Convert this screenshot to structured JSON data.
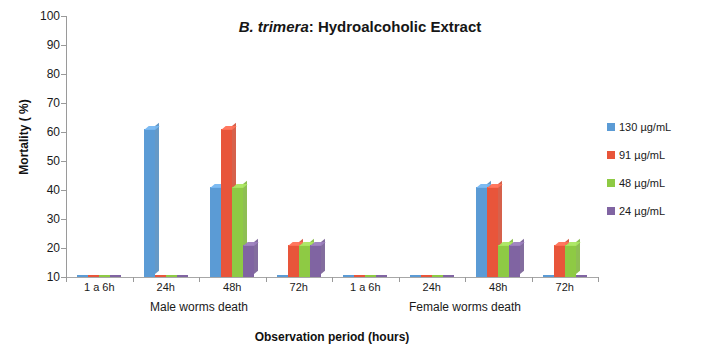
{
  "chart_data": {
    "type": "bar",
    "title": "B. trimera: Hydroalcoholic Extract",
    "title_species": "B. trimera",
    "title_rest": ": Hydroalcoholic Extract",
    "xlabel": "Observation period (hours)",
    "ylabel": "Mortality ( %)",
    "ylim": [
      10,
      100
    ],
    "ytick_step": 10,
    "yticks": [
      "100",
      "90",
      "80",
      "70",
      "60",
      "50",
      "40",
      "30",
      "20",
      "10"
    ],
    "grid": false,
    "legend_position": "right",
    "categories": [
      "1 a 6h",
      "24h",
      "48h",
      "72h",
      "1 a 6h",
      "24h",
      "48h",
      "72h"
    ],
    "groups": [
      {
        "label": "Male worms death",
        "categories": [
          "1 a 6h",
          "24h",
          "48h",
          "72h"
        ]
      },
      {
        "label": "Female worms death",
        "categories": [
          "1 a 6h",
          "24h",
          "48h",
          "72h"
        ]
      }
    ],
    "series": [
      {
        "name": "130 µg/mL",
        "color": "#5B9BD5",
        "values": [
          0,
          61,
          41,
          0,
          0,
          0,
          41,
          0
        ]
      },
      {
        "name": "91 µg/mL",
        "color": "#E8553A",
        "values": [
          0,
          0,
          61,
          21,
          0,
          0,
          41,
          21
        ]
      },
      {
        "name": "48 µg/mL",
        "color": "#8ECA44",
        "values": [
          0,
          0,
          41,
          21,
          0,
          0,
          21,
          21
        ]
      },
      {
        "name": "24 µg/mL",
        "color": "#8064A2",
        "values": [
          0,
          0,
          21,
          21,
          0,
          0,
          21,
          0
        ]
      }
    ]
  },
  "legend": {
    "items": [
      {
        "label": "130 µg/mL",
        "color": "#5B9BD5"
      },
      {
        "label": "91 µg/mL",
        "color": "#E8553A"
      },
      {
        "label": "48 µg/mL",
        "color": "#8ECA44"
      },
      {
        "label": "24 µg/mL",
        "color": "#8064A2"
      }
    ]
  },
  "colors": {
    "axis": "#9a9a9a",
    "text": "#1a1a1a",
    "floor_top": "#ffffff",
    "floor_edge": "#7f7f7f"
  }
}
